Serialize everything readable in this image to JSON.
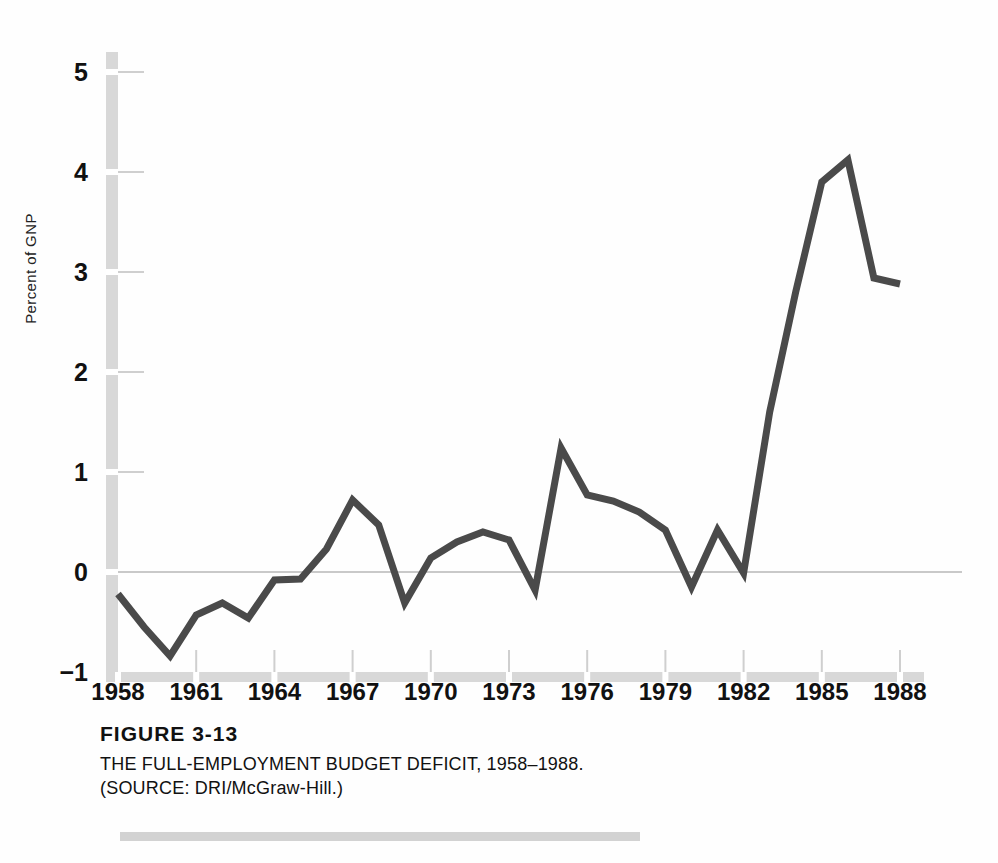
{
  "figure": {
    "number_label": "FIGURE 3-13",
    "title": "THE FULL-EMPLOYMENT BUDGET DEFICIT, 1958–1988.",
    "source_prefix": "(S",
    "source_small": "OURCE",
    "source_rest": ": DRI/McGraw-Hill.)",
    "source_full": "(SOURCE: DRI/McGraw-Hill.)"
  },
  "style": {
    "line_color": "#4a4a4a",
    "axis_color": "#d8d8d8",
    "zero_line_color": "#c9c9c9",
    "tick_color": "#cfcfcf",
    "rule_color": "#d2d2d2",
    "background": "#fefefe"
  },
  "chart_data": {
    "type": "line",
    "title": "THE FULL-EMPLOYMENT BUDGET DEFICIT, 1958–1988.",
    "subtitle": "FIGURE 3-13",
    "source": "DRI/McGraw-Hill.",
    "xlabel": "",
    "ylabel": "Percent of GNP",
    "xlim": [
      1958,
      1988
    ],
    "ylim": [
      -1,
      5.2
    ],
    "ytick_labels": [
      "5",
      "4",
      "3",
      "2",
      "1",
      "0",
      "−1"
    ],
    "ytick_values": [
      5,
      4,
      3,
      2,
      1,
      0,
      -1
    ],
    "xtick_labels": [
      "1958",
      "1961",
      "1964",
      "1967",
      "1970",
      "1973",
      "1976",
      "1979",
      "1982",
      "1985",
      "1988"
    ],
    "xtick_values": [
      1958,
      1961,
      1964,
      1967,
      1970,
      1973,
      1976,
      1979,
      1982,
      1985,
      1988
    ],
    "grid": false,
    "legend": "none",
    "zero_line": true,
    "x": [
      1958,
      1959,
      1960,
      1961,
      1962,
      1963,
      1964,
      1965,
      1966,
      1967,
      1968,
      1969,
      1970,
      1971,
      1972,
      1973,
      1974,
      1975,
      1976,
      1977,
      1978,
      1979,
      1980,
      1981,
      1982,
      1983,
      1984,
      1985,
      1986,
      1987,
      1988
    ],
    "values": [
      -0.22,
      -0.55,
      -0.84,
      -0.43,
      -0.31,
      -0.46,
      -0.08,
      -0.07,
      0.23,
      0.72,
      0.47,
      -0.31,
      0.14,
      0.3,
      0.4,
      0.32,
      -0.18,
      1.24,
      0.77,
      0.71,
      0.6,
      0.42,
      -0.15,
      0.42,
      -0.01,
      1.6,
      2.8,
      3.9,
      4.12,
      2.94,
      2.88
    ],
    "series_name": "Full-employment budget deficit (percent of GNP)"
  }
}
